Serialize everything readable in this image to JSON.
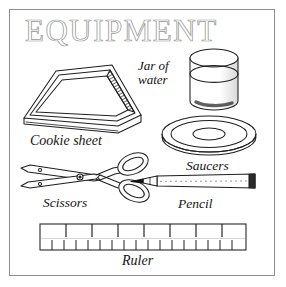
{
  "page": {
    "title": "EQUIPMENT",
    "kind": "line-art-illustration",
    "background_color": "#ffffff",
    "ink_color": "#1a1a1a",
    "frame_color": "#8d8d8d"
  },
  "items": [
    {
      "id": "cookie-sheet",
      "label": "Cookie sheet",
      "icon": "cookie-sheet-icon",
      "description": "rectangular baking tray drawn in perspective with raised rim and hatched inner right edge"
    },
    {
      "id": "jar-of-water",
      "label": "Jar of water",
      "label_line_1": "Jar of",
      "label_line_2": "water",
      "icon": "jar-of-water-icon",
      "description": "cylindrical glass jar with elliptical rim, water line and shaded base"
    },
    {
      "id": "saucers",
      "label": "Saucers",
      "icon": "saucers-icon",
      "description": "shallow round saucer shown as concentric ellipses"
    },
    {
      "id": "scissors",
      "label": "Scissors",
      "icon": "scissors-icon",
      "description": "pair of scissors with blades pointing left and two oval finger loops at right"
    },
    {
      "id": "pencil",
      "label": "Pencil",
      "icon": "pencil-icon",
      "description": "horizontal pencil with dark sharpened tip at left and dark ferrule at right"
    },
    {
      "id": "ruler",
      "label": "Ruler",
      "icon": "ruler-icon",
      "description": "long straight ruler with seven major tick marks along the top edge and sixteen minor tick marks along the bottom edge",
      "major_ticks": 7,
      "minor_ticks": 16
    }
  ]
}
